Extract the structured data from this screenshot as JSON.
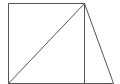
{
  "diagram": {
    "stroke_color": "#555555",
    "background": "#ffffff",
    "points": {
      "bottom_left": [
        8,
        83
      ],
      "top_left": [
        8,
        3
      ],
      "top_right": [
        84,
        3
      ],
      "bottom_right_square": [
        84,
        83
      ],
      "bottom_far_right": [
        113,
        83
      ]
    },
    "segments": [
      {
        "name": "square-left",
        "from": "top_left",
        "to": "bottom_left"
      },
      {
        "name": "square-top",
        "from": "top_left",
        "to": "top_right"
      },
      {
        "name": "square-right",
        "from": "top_right",
        "to": "bottom_right_square"
      },
      {
        "name": "base-line",
        "from": "bottom_left",
        "to": "bottom_far_right"
      },
      {
        "name": "diagonal",
        "from": "bottom_left",
        "to": "top_right"
      },
      {
        "name": "triangle-hypotenuse",
        "from": "top_right",
        "to": "bottom_far_right"
      }
    ]
  }
}
